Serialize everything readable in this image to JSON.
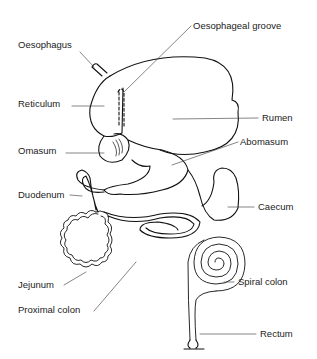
{
  "diagram": {
    "labels": [
      {
        "id": "oesophagus",
        "text": "Oesophagus",
        "x": 18,
        "y": 40
      },
      {
        "id": "oesophageal-groove",
        "text": "Oesophageal groove",
        "x": 193,
        "y": 21
      },
      {
        "id": "reticulum",
        "text": "Reticulum",
        "x": 18,
        "y": 99
      },
      {
        "id": "rumen",
        "text": "Rumen",
        "x": 262,
        "y": 113
      },
      {
        "id": "omasum",
        "text": "Omasum",
        "x": 18,
        "y": 146
      },
      {
        "id": "abomasum",
        "text": "Abomasum",
        "x": 240,
        "y": 137
      },
      {
        "id": "duodenum",
        "text": "Duodenum",
        "x": 18,
        "y": 190
      },
      {
        "id": "caecum",
        "text": "Caecum",
        "x": 258,
        "y": 202
      },
      {
        "id": "jejunum",
        "text": "Jejunum",
        "x": 18,
        "y": 280
      },
      {
        "id": "spiral-colon",
        "text": "Spiral colon",
        "x": 238,
        "y": 277
      },
      {
        "id": "proximal-colon",
        "text": "Proximal colon",
        "x": 18,
        "y": 305
      },
      {
        "id": "rectum",
        "text": "Rectum",
        "x": 260,
        "y": 329
      }
    ]
  }
}
